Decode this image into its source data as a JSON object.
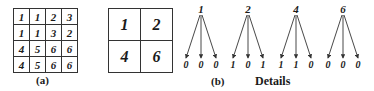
{
  "figure": {
    "panel_a": {
      "label": "(a)",
      "grid": [
        [
          "1",
          "1",
          "2",
          "3"
        ],
        [
          "1",
          "1",
          "3",
          "2"
        ],
        [
          "4",
          "5",
          "6",
          "6"
        ],
        [
          "4",
          "5",
          "6",
          "6"
        ]
      ]
    },
    "panel_b": {
      "label": "(b)",
      "grid": [
        [
          "1",
          "2"
        ],
        [
          "4",
          "6"
        ]
      ]
    },
    "details": {
      "label": "Details",
      "trees": [
        {
          "root": "1",
          "children": [
            "0",
            "0",
            "0"
          ]
        },
        {
          "root": "2",
          "children": [
            "1",
            "0",
            "1"
          ]
        },
        {
          "root": "4",
          "children": [
            "1",
            "1",
            "0"
          ]
        },
        {
          "root": "6",
          "children": [
            "0",
            "0",
            "0"
          ]
        }
      ]
    }
  }
}
